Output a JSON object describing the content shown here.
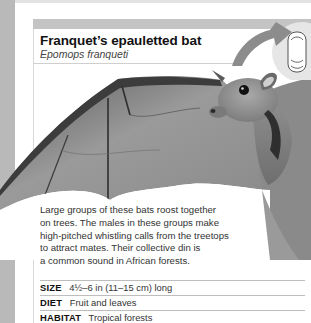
{
  "header": {
    "title": "Franquet’s epauletted bat",
    "subtitle": "Epomops franqueti"
  },
  "scale_badge": {
    "icon": "thumb-size-comparison-icon",
    "color": "#8c8c8c"
  },
  "photo": {
    "subject": "bat-photo",
    "description": "Grayscale photo of a fruit bat with outstretched wing"
  },
  "description_lines": [
    "Large groups of these bats roost together",
    "on trees. The males in these groups make",
    "high-pitched whistling calls from the treetops",
    "to attract mates. Their collective din is",
    "a common sound in African forests."
  ],
  "facts": [
    {
      "label": "SIZE",
      "value": "4½–6 in (11–15 cm) long"
    },
    {
      "label": "DIET",
      "value": "Fruit and leaves"
    },
    {
      "label": "HABITAT",
      "value": "Tropical forests"
    }
  ],
  "colors": {
    "spine": "#b9b9b9",
    "header_bar": "#c4c4c4",
    "title": "#111111",
    "text": "#333333",
    "rule": "#bdbdbd"
  }
}
